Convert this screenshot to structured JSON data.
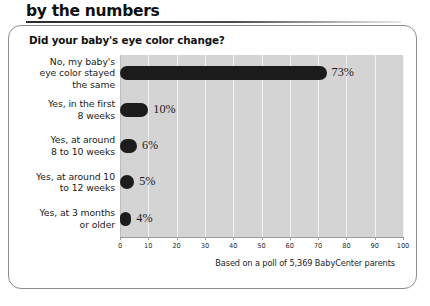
{
  "header": {
    "title": "by the numbers"
  },
  "card": {
    "question": "Did your baby's eye color change?"
  },
  "chart_data": {
    "type": "bar",
    "orientation": "horizontal",
    "title": "Did your baby's eye color change?",
    "xlabel": "",
    "ylabel": "",
    "xlim": [
      0,
      100
    ],
    "grid": true,
    "legend": false,
    "categories": [
      "No, my baby's\neye color stayed\nthe same",
      "Yes, in the first\n8 weeks",
      "Yes, at around\n8 to 10 weeks",
      "Yes, at around 10\nto 12 weeks",
      "Yes, at 3 months\nor older"
    ],
    "values": [
      73,
      10,
      6,
      5,
      4
    ],
    "value_labels": [
      "73%",
      "10%",
      "6%",
      "5%",
      "4%"
    ],
    "xticks": [
      0,
      10,
      20,
      30,
      40,
      50,
      60,
      70,
      80,
      90,
      100
    ],
    "xticklabels": [
      "0",
      "10",
      "20",
      "30",
      "40",
      "50",
      "60",
      "70",
      "80",
      "90",
      "100"
    ],
    "annotation": "Based on a poll of 5,369 BabyCenter parents",
    "bar_color": "#1c1c1c",
    "plot_background": "#d4d4d4",
    "gridline_color": "#f2f2f2"
  },
  "rows": [
    {
      "label_line1": "No, my baby's",
      "label_line2": "eye color stayed",
      "label_line3": "the same",
      "value": 73,
      "value_label": "73%"
    },
    {
      "label_line1": "Yes, in the first",
      "label_line2": "8 weeks",
      "label_line3": "",
      "value": 10,
      "value_label": "10%"
    },
    {
      "label_line1": "Yes, at around",
      "label_line2": "8 to 10 weeks",
      "label_line3": "",
      "value": 6,
      "value_label": "6%"
    },
    {
      "label_line1": "Yes, at around 10",
      "label_line2": "to 12 weeks",
      "label_line3": "",
      "value": 5,
      "value_label": "5%"
    },
    {
      "label_line1": "Yes, at 3 months",
      "label_line2": "or older",
      "label_line3": "",
      "value": 4,
      "value_label": "4%"
    }
  ],
  "footnote": {
    "text": "Based on a poll of 5,369 BabyCenter parents"
  }
}
